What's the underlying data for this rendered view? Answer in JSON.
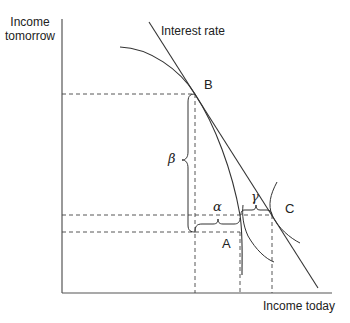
{
  "diagram": {
    "y_axis_label_line1": "Income",
    "y_axis_label_line2": "tomorrow",
    "x_axis_label": "Income today",
    "line_label": "Interest rate",
    "points": {
      "A": "A",
      "B": "B",
      "C": "C"
    },
    "braces": {
      "alpha": "α",
      "beta": "β",
      "gamma": "γ"
    },
    "colors": {
      "line": "#333333",
      "dashed": "#444444",
      "background": "#ffffff"
    }
  }
}
